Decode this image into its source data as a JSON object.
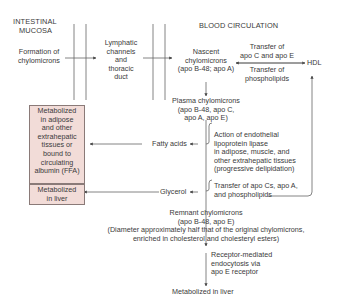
{
  "headers": {
    "intestinal": [
      "INTESTINAL",
      "MUCOSA"
    ],
    "blood": "BLOOD CIRCULATION"
  },
  "nodes": {
    "formation": [
      "Formation of",
      "chylomicrons"
    ],
    "lymphatic": [
      "Lymphatic",
      "channels",
      "and",
      "thoracic",
      "duct"
    ],
    "nascent": [
      "Nascent",
      "chylomicrons",
      "(apo B-48; apo A)"
    ],
    "hdl": "HDL",
    "transfer_top": [
      "Transfer of",
      "apo C and apo E"
    ],
    "transfer_bottom": [
      "Transfer of",
      "phospholipids"
    ],
    "plasma": [
      "Plasma chylomicrons",
      "(apo B-48, apo C,",
      "apo A, apo E)"
    ],
    "fatty_acids": "Fatty acids",
    "lipase_action": [
      "Action of endothelial",
      "lipoprotein lipase",
      "in adipose, muscle, and",
      "other extrahepatic tissues",
      "(progressive delipidation)"
    ],
    "glycerol": "Glycerol",
    "transfer_apo_cs": [
      "Transfer of apo Cs, apo A,",
      "and phospholipids"
    ],
    "remnant": [
      "Remnant chylomicrons",
      "(apo B-48, apo E)",
      "(Diameter approximately half that of the original chylomicrons,",
      "enriched in cholesterol and cholesteryl esters)"
    ],
    "receptor": [
      "Receptor-mediated",
      "endocytosis via",
      "apo E receptor"
    ],
    "metabolized_liver_final": "Metabolized in liver"
  },
  "boxes": {
    "adipose": [
      "Metabolized",
      "in adipose",
      "and other",
      "extrahepatic",
      "tissues or",
      "bound to",
      "circulating",
      "albumin (FFA)"
    ],
    "liver": [
      "Metabolized",
      "in liver"
    ]
  },
  "colors": {
    "box_fill": "#f2dcd8",
    "box_border": "#8a7a78",
    "line": "#555555",
    "text": "#3a3a3a"
  }
}
